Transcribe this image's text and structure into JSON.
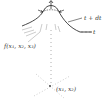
{
  "diagram": {
    "type": "hand-drawn-sketch",
    "labels": {
      "curve_upper": "t + dt",
      "curve_lower": "t",
      "surface": "f(x₁, x₂, x₃)",
      "point": "(x₁, x₂)"
    },
    "colors": {
      "ink": "#333333",
      "faint": "#9a9a9a",
      "background": "#ffffff"
    }
  }
}
